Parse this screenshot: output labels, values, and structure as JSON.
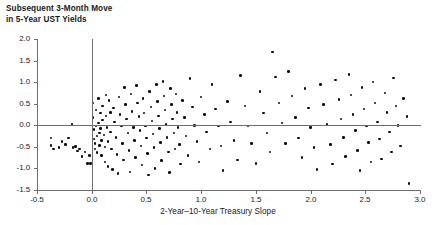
{
  "chart_data": {
    "type": "scatter",
    "title": "Subsequent 3-Month Move\nin 5-Year UST Yields",
    "xlabel": "2-Year–10-Year Treasury Slope",
    "ylabel": "",
    "xlim": [
      -0.5,
      3.0
    ],
    "ylim": [
      -1.5,
      2.0
    ],
    "xticks": [
      -0.5,
      0.0,
      0.5,
      1.0,
      1.5,
      2.0,
      2.5,
      3.0
    ],
    "xticklabels": [
      "-0.5",
      "0.0",
      "0.5",
      "1.0",
      "1.5",
      "2.0",
      "2.5",
      "3.0"
    ],
    "yticks": [
      -1.5,
      -1.0,
      -0.5,
      0.0,
      0.5,
      1.0,
      1.5,
      2.0
    ],
    "yticklabels": [
      "-1.5",
      "-1.0",
      "-0.5",
      "0.0",
      "0.5",
      "1.0",
      "1.5",
      "2.0"
    ],
    "grid": false,
    "legend": null,
    "reference_lines": [
      {
        "axis": "x",
        "value": 0.0
      },
      {
        "axis": "y",
        "value": 0.0
      }
    ],
    "marker": {
      "shape": "circle",
      "color": "#0d0d0d",
      "size": 2.6
    },
    "points": [
      [
        -0.37,
        -0.3
      ],
      [
        -0.37,
        -0.47
      ],
      [
        -0.35,
        -0.55
      ],
      [
        -0.3,
        -0.52
      ],
      [
        -0.27,
        -0.38
      ],
      [
        -0.24,
        -0.45
      ],
      [
        -0.21,
        -0.3
      ],
      [
        -0.18,
        0.02
      ],
      [
        -0.17,
        -0.52
      ],
      [
        -0.15,
        -0.49
      ],
      [
        -0.13,
        -0.6
      ],
      [
        -0.11,
        -0.55
      ],
      [
        -0.09,
        -0.72
      ],
      [
        -0.06,
        -0.62
      ],
      [
        -0.04,
        -0.88
      ],
      [
        -0.02,
        -0.7
      ],
      [
        -0.01,
        -0.88
      ],
      [
        0.01,
        0.52
      ],
      [
        0.01,
        0.18
      ],
      [
        0.02,
        -0.1
      ],
      [
        0.02,
        -0.32
      ],
      [
        0.03,
        -0.42
      ],
      [
        0.03,
        -0.55
      ],
      [
        0.04,
        0.35
      ],
      [
        0.04,
        -0.02
      ],
      [
        0.05,
        -0.25
      ],
      [
        0.05,
        -0.63
      ],
      [
        0.06,
        0.62
      ],
      [
        0.06,
        0.05
      ],
      [
        0.07,
        -0.18
      ],
      [
        0.07,
        -0.47
      ],
      [
        0.08,
        0.28
      ],
      [
        0.08,
        -0.08
      ],
      [
        0.09,
        -0.35
      ],
      [
        0.09,
        -0.7
      ],
      [
        0.1,
        0.45
      ],
      [
        0.1,
        0.12
      ],
      [
        0.11,
        -0.22
      ],
      [
        0.12,
        -0.5
      ],
      [
        0.12,
        -0.85
      ],
      [
        0.13,
        0.7
      ],
      [
        0.13,
        0.22
      ],
      [
        0.14,
        -0.05
      ],
      [
        0.15,
        -0.38
      ],
      [
        0.15,
        -0.95
      ],
      [
        0.16,
        0.58
      ],
      [
        0.17,
        0.3
      ],
      [
        0.17,
        -0.15
      ],
      [
        0.18,
        -0.55
      ],
      [
        0.19,
        -1.02
      ],
      [
        0.2,
        0.4
      ],
      [
        0.21,
        0.08
      ],
      [
        0.22,
        -0.28
      ],
      [
        0.23,
        -0.68
      ],
      [
        0.24,
        -1.12
      ],
      [
        0.25,
        0.66
      ],
      [
        0.26,
        0.25
      ],
      [
        0.27,
        -0.02
      ],
      [
        0.28,
        -0.42
      ],
      [
        0.29,
        -0.8
      ],
      [
        0.3,
        0.88
      ],
      [
        0.31,
        0.48
      ],
      [
        0.32,
        0.15
      ],
      [
        0.33,
        -0.18
      ],
      [
        0.34,
        -0.58
      ],
      [
        0.35,
        -1.08
      ],
      [
        0.36,
        0.72
      ],
      [
        0.37,
        0.32
      ],
      [
        0.38,
        -0.05
      ],
      [
        0.39,
        -0.35
      ],
      [
        0.4,
        -0.75
      ],
      [
        0.41,
        0.92
      ],
      [
        0.42,
        0.52
      ],
      [
        0.43,
        0.2
      ],
      [
        0.44,
        -0.12
      ],
      [
        0.45,
        -0.48
      ],
      [
        0.46,
        -0.92
      ],
      [
        0.47,
        0.62
      ],
      [
        0.48,
        0.28
      ],
      [
        0.49,
        -0.02
      ],
      [
        0.5,
        -0.3
      ],
      [
        0.51,
        -0.65
      ],
      [
        0.52,
        -1.15
      ],
      [
        0.53,
        0.78
      ],
      [
        0.54,
        0.42
      ],
      [
        0.55,
        0.1
      ],
      [
        0.56,
        -0.2
      ],
      [
        0.57,
        -0.52
      ],
      [
        0.58,
        -1.0
      ],
      [
        0.59,
        0.95
      ],
      [
        0.6,
        0.55
      ],
      [
        0.61,
        0.22
      ],
      [
        0.62,
        -0.08
      ],
      [
        0.63,
        -0.4
      ],
      [
        0.64,
        -0.82
      ],
      [
        0.65,
        1.02
      ],
      [
        0.66,
        0.68
      ],
      [
        0.67,
        0.35
      ],
      [
        0.68,
        0.02
      ],
      [
        0.69,
        -0.28
      ],
      [
        0.7,
        -0.62
      ],
      [
        0.71,
        -1.1
      ],
      [
        0.72,
        0.85
      ],
      [
        0.73,
        0.48
      ],
      [
        0.74,
        0.14
      ],
      [
        0.75,
        -0.18
      ],
      [
        0.76,
        -0.55
      ],
      [
        0.77,
        0.72
      ],
      [
        0.78,
        0.3
      ],
      [
        0.79,
        -0.05
      ],
      [
        0.8,
        -0.45
      ],
      [
        0.81,
        -0.9
      ],
      [
        0.83,
        0.58
      ],
      [
        0.85,
        0.18
      ],
      [
        0.86,
        -0.25
      ],
      [
        0.88,
        -0.7
      ],
      [
        0.9,
        1.08
      ],
      [
        0.92,
        0.42
      ],
      [
        0.94,
        0.0
      ],
      [
        0.96,
        -0.38
      ],
      [
        0.98,
        -0.85
      ],
      [
        1.0,
        0.65
      ],
      [
        1.03,
        0.25
      ],
      [
        1.05,
        -0.15
      ],
      [
        1.08,
        -0.55
      ],
      [
        1.1,
        0.95
      ],
      [
        1.13,
        0.38
      ],
      [
        1.16,
        -0.02
      ],
      [
        1.18,
        -0.48
      ],
      [
        1.2,
        -1.05
      ],
      [
        1.24,
        0.55
      ],
      [
        1.27,
        0.08
      ],
      [
        1.3,
        -0.35
      ],
      [
        1.33,
        -0.8
      ],
      [
        1.36,
        1.15
      ],
      [
        1.4,
        0.45
      ],
      [
        1.43,
        -0.02
      ],
      [
        1.46,
        -0.42
      ],
      [
        1.5,
        -0.88
      ],
      [
        1.54,
        0.78
      ],
      [
        1.57,
        0.28
      ],
      [
        1.6,
        -0.18
      ],
      [
        1.63,
        -0.62
      ],
      [
        1.65,
        1.7
      ],
      [
        1.68,
        1.12
      ],
      [
        1.71,
        0.52
      ],
      [
        1.74,
        0.05
      ],
      [
        1.77,
        -0.42
      ],
      [
        1.8,
        1.25
      ],
      [
        1.83,
        0.68
      ],
      [
        1.86,
        0.18
      ],
      [
        1.89,
        -0.3
      ],
      [
        1.92,
        -0.75
      ],
      [
        1.95,
        0.85
      ],
      [
        1.98,
        0.4
      ],
      [
        2.0,
        -0.05
      ],
      [
        2.03,
        -0.52
      ],
      [
        2.06,
        -1.02
      ],
      [
        2.09,
        0.95
      ],
      [
        2.12,
        0.48
      ],
      [
        2.15,
        0.02
      ],
      [
        2.18,
        -0.45
      ],
      [
        2.2,
        -0.9
      ],
      [
        2.23,
        1.05
      ],
      [
        2.26,
        0.6
      ],
      [
        2.28,
        0.15
      ],
      [
        2.3,
        -0.28
      ],
      [
        2.32,
        -0.72
      ],
      [
        2.35,
        1.18
      ],
      [
        2.37,
        0.7
      ],
      [
        2.39,
        0.25
      ],
      [
        2.41,
        -0.12
      ],
      [
        2.43,
        -0.58
      ],
      [
        2.45,
        -1.05
      ],
      [
        2.47,
        0.88
      ],
      [
        2.49,
        0.38
      ],
      [
        2.51,
        -0.02
      ],
      [
        2.53,
        -0.4
      ],
      [
        2.55,
        -0.85
      ],
      [
        2.57,
        1.0
      ],
      [
        2.59,
        0.52
      ],
      [
        2.61,
        0.08
      ],
      [
        2.63,
        -0.32
      ],
      [
        2.65,
        -0.78
      ],
      [
        2.68,
        0.75
      ],
      [
        2.7,
        0.3
      ],
      [
        2.72,
        -0.15
      ],
      [
        2.74,
        -0.62
      ],
      [
        2.76,
        1.1
      ],
      [
        2.78,
        0.45
      ],
      [
        2.8,
        0.0
      ],
      [
        2.82,
        -0.48
      ],
      [
        2.85,
        0.62
      ],
      [
        2.88,
        0.2
      ],
      [
        2.9,
        -1.35
      ]
    ]
  }
}
